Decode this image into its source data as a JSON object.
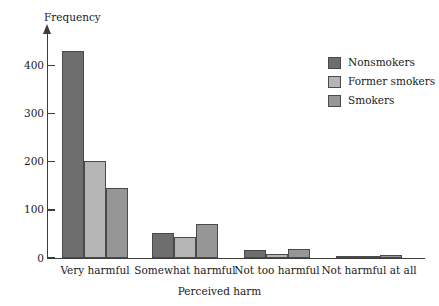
{
  "chart_data": {
    "type": "bar",
    "title": "",
    "xlabel": "Perceived harm",
    "ylabel": "Frequency",
    "categories": [
      "Very harmful",
      "Somewhat harmful",
      "Not too harmful",
      "Not harmful at all"
    ],
    "series": [
      {
        "name": "Nonsmokers",
        "color": "#6e6e6e",
        "values": [
          430,
          52,
          17,
          3
        ]
      },
      {
        "name": "Former smokers",
        "color": "#b5b5b5",
        "values": [
          202,
          43,
          9,
          2
        ]
      },
      {
        "name": "Smokers",
        "color": "#969696",
        "values": [
          145,
          71,
          18,
          7
        ]
      }
    ],
    "ylim": [
      0,
      470
    ],
    "yticks": [
      0,
      100,
      200,
      300,
      400
    ],
    "ytick_labels": [
      "0",
      "100",
      "200",
      "300",
      "400"
    ],
    "grid": false,
    "legend_position": "top-right",
    "axis_color": "#3d3d3d"
  }
}
